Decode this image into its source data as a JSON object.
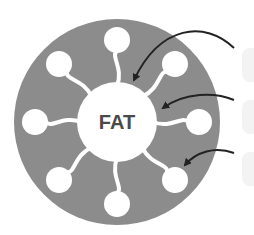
{
  "diagram": {
    "type": "micelle",
    "core_label": "FAT",
    "colors": {
      "ring": "#8c8c8c",
      "core": "#ffffff",
      "head": "#ffffff",
      "arrow": "#222222",
      "label_ghost": "#f3f3f3",
      "text": "#4a4a4a"
    },
    "molecule_count": 8,
    "arrows": [
      {
        "target": "core"
      },
      {
        "target": "tail"
      },
      {
        "target": "head"
      }
    ],
    "ghost_labels": 3
  }
}
